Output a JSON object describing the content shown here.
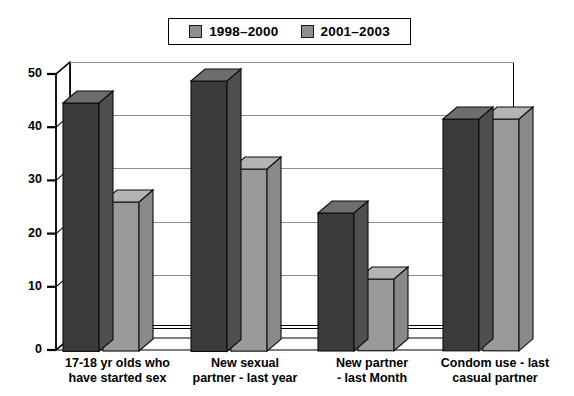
{
  "chart_data": {
    "type": "bar",
    "title": "",
    "subtitle": "",
    "xlabel": "",
    "ylabel": "",
    "ylim": [
      0,
      50
    ],
    "yticks": [
      0,
      10,
      20,
      30,
      40,
      50
    ],
    "ytick_labels": [
      "0",
      "10",
      "20",
      "30",
      "40",
      "50"
    ],
    "grid": true,
    "grid_axis": "y",
    "legend_position": "top-center",
    "style": "3d-grouped-bar",
    "categories": [
      "17-18 yr olds who\nhave started sex",
      "New sexual\npartner - last year",
      "New partner\n- last Month",
      "Condom use - last\ncasual partner"
    ],
    "series": [
      {
        "name": "1998–2000",
        "color": "#3b3b3b",
        "side_color": "#4f4f4f",
        "top_color": "#6e6e6e",
        "values": [
          45,
          49,
          25,
          42
        ]
      },
      {
        "name": "2001–2003",
        "color": "#9a9a9a",
        "side_color": "#8a8a8a",
        "top_color": "#b4b4b4",
        "values": [
          27,
          33,
          13,
          42
        ]
      }
    ]
  },
  "legend": {
    "items": [
      {
        "label": "1998–2000",
        "swatch_color": "#8f8f8f"
      },
      {
        "label": "2001–2003",
        "swatch_color": "#8f8f8f"
      }
    ]
  },
  "colors": {
    "axis": "#000000",
    "gridline": "#8d8d8d",
    "background": "#ffffff",
    "series1": "#3b3b3b",
    "series2": "#9a9a9a"
  }
}
